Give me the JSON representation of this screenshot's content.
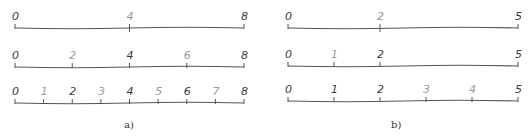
{
  "figure": {
    "panel_a": {
      "caption": "a)",
      "rows": [
        {
          "ticks": [
            {
              "label": "0",
              "pos": 0,
              "dark": true
            },
            {
              "label": "4",
              "pos": 4,
              "dark": false
            },
            {
              "label": "8",
              "pos": 8,
              "dark": true
            }
          ],
          "max": 8
        },
        {
          "ticks": [
            {
              "label": "0",
              "pos": 0,
              "dark": true
            },
            {
              "label": "2",
              "pos": 2,
              "dark": false
            },
            {
              "label": "4",
              "pos": 4,
              "dark": true
            },
            {
              "label": "6",
              "pos": 6,
              "dark": false
            },
            {
              "label": "8",
              "pos": 8,
              "dark": true
            }
          ],
          "max": 8
        },
        {
          "ticks": [
            {
              "label": "0",
              "pos": 0,
              "dark": true
            },
            {
              "label": "1",
              "pos": 1,
              "dark": false
            },
            {
              "label": "2",
              "pos": 2,
              "dark": true
            },
            {
              "label": "3",
              "pos": 3,
              "dark": false
            },
            {
              "label": "4",
              "pos": 4,
              "dark": true
            },
            {
              "label": "5",
              "pos": 5,
              "dark": false
            },
            {
              "label": "6",
              "pos": 6,
              "dark": true
            },
            {
              "label": "7",
              "pos": 7,
              "dark": false
            },
            {
              "label": "8",
              "pos": 8,
              "dark": true
            }
          ],
          "max": 8
        }
      ]
    },
    "panel_b": {
      "caption": "b)",
      "rows": [
        {
          "ticks": [
            {
              "label": "0",
              "pos": 0,
              "dark": true
            },
            {
              "label": "2",
              "pos": 2,
              "dark": false
            },
            {
              "label": "5",
              "pos": 5,
              "dark": true
            }
          ],
          "max": 5
        },
        {
          "ticks": [
            {
              "label": "0",
              "pos": 0,
              "dark": true
            },
            {
              "label": "1",
              "pos": 1,
              "dark": false
            },
            {
              "label": "2",
              "pos": 2,
              "dark": true
            },
            {
              "label": "5",
              "pos": 5,
              "dark": true
            }
          ],
          "max": 5
        },
        {
          "ticks": [
            {
              "label": "0",
              "pos": 0,
              "dark": true
            },
            {
              "label": "1",
              "pos": 1,
              "dark": true
            },
            {
              "label": "2",
              "pos": 2,
              "dark": true
            },
            {
              "label": "3",
              "pos": 3,
              "dark": false
            },
            {
              "label": "4",
              "pos": 4,
              "dark": false
            },
            {
              "label": "5",
              "pos": 5,
              "dark": true
            }
          ],
          "max": 5
        }
      ]
    },
    "colors": {
      "dark": "#3a3a3a",
      "light": "#9a9a9a",
      "line": "#555555"
    }
  }
}
